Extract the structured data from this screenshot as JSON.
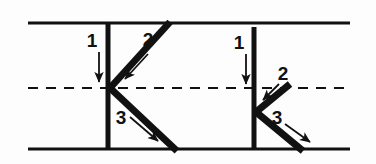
{
  "figure": {
    "canvas": {
      "width": 376,
      "height": 164,
      "background": "#fdfdfd"
    },
    "colors": {
      "line": "#111111",
      "boundary": "#111111",
      "centerline": "#111111",
      "label": "#111111"
    },
    "boundaries": {
      "top_line": {
        "y": 23,
        "x1": 28,
        "x2": 350,
        "style": "solid",
        "thickness": 3
      },
      "bottom_line": {
        "y": 149,
        "x1": 28,
        "x2": 350,
        "style": "solid",
        "thickness": 3
      },
      "center_line": {
        "y": 88,
        "x1": 28,
        "x2": 350,
        "style": "dashed",
        "thickness": 2,
        "dash": "10 8"
      }
    },
    "junctions": [
      {
        "id": "left-junction",
        "node": {
          "x": 110,
          "y": 88
        },
        "segments": [
          {
            "id": "left-segment-1",
            "label": "1",
            "label_pos": {
              "x": 92,
              "y": 47
            },
            "path": {
              "x1": 108,
              "y1": 23,
              "x2": 108,
              "y2": 149
            },
            "thickness": 5,
            "arrow": {
              "x1": 99,
              "y1": 52,
              "x2": 99,
              "y2": 82,
              "direction": "down"
            }
          },
          {
            "id": "left-segment-2",
            "label": "2",
            "label_pos": {
              "x": 142,
              "y": 46
            },
            "path": {
              "x1": 170,
              "y1": 22,
              "x2": 110,
              "y2": 88
            },
            "thickness": 7,
            "arrow": {
              "x1": 148,
              "y1": 54,
              "x2": 123,
              "y2": 80,
              "direction": "down-left"
            }
          },
          {
            "id": "left-segment-3",
            "label": "3",
            "label_pos": {
              "x": 116,
              "y": 124
            },
            "path": {
              "x1": 110,
              "y1": 88,
              "x2": 177,
              "y2": 151
            },
            "thickness": 7,
            "arrow": {
              "x1": 130,
              "y1": 117,
              "x2": 160,
              "y2": 143,
              "direction": "down-right"
            }
          }
        ]
      },
      {
        "id": "right-junction",
        "node": {
          "x": 256,
          "y": 112
        },
        "segments": [
          {
            "id": "right-segment-1",
            "label": "1",
            "label_pos": {
              "x": 239,
              "y": 49
            },
            "path": {
              "x1": 254,
              "y1": 27,
              "x2": 254,
              "y2": 149
            },
            "thickness": 5,
            "arrow": {
              "x1": 246,
              "y1": 54,
              "x2": 246,
              "y2": 84,
              "direction": "down"
            }
          },
          {
            "id": "right-segment-2",
            "label": "2",
            "label_pos": {
              "x": 277,
              "y": 80
            },
            "path": {
              "x1": 290,
              "y1": 84,
              "x2": 256,
              "y2": 112
            },
            "thickness": 7,
            "arrow": {
              "x1": 279,
              "y1": 84,
              "x2": 262,
              "y2": 101,
              "direction": "down-left"
            }
          },
          {
            "id": "right-segment-3",
            "label": "3",
            "label_pos": {
              "x": 272,
              "y": 121
            },
            "path": {
              "x1": 256,
              "y1": 112,
              "x2": 303,
              "y2": 151
            },
            "thickness": 7,
            "arrow": {
              "x1": 285,
              "y1": 124,
              "x2": 312,
              "y2": 144,
              "direction": "down-right"
            }
          }
        ]
      }
    ]
  }
}
